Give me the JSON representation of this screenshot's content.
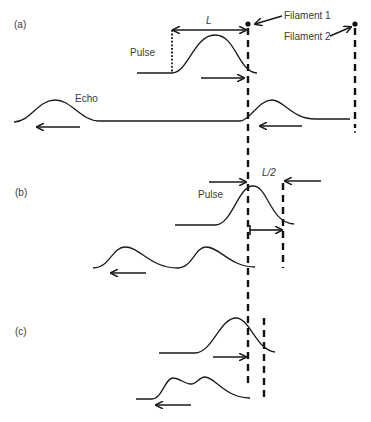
{
  "panels": {
    "a": {
      "label": "(a)"
    },
    "b": {
      "label": "(b)"
    },
    "c": {
      "label": "(c)"
    }
  },
  "labels": {
    "filament1": "Filament 1",
    "filament2": "Filament 2",
    "pulse_a": "Pulse",
    "echo": "Echo",
    "length_L": "L",
    "pulse_b": "Pulse",
    "half_length": "L/2"
  },
  "colors": {
    "ink": "#1a1a1a",
    "text": "#3a3a3a",
    "background": "#ffffff"
  }
}
